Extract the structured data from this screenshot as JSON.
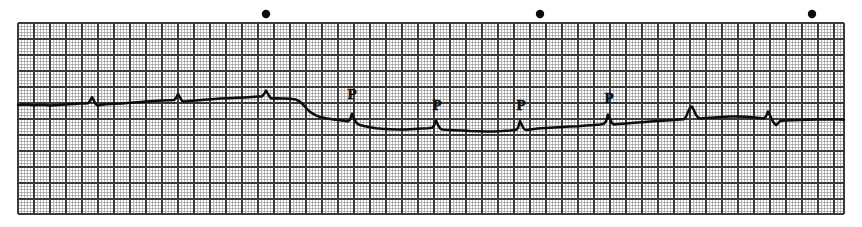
{
  "figure": {
    "kind": "ecg-rhythm-strip",
    "width": 862,
    "height": 227,
    "background_color": "#ffffff",
    "paper_color": "#fdfdfd"
  },
  "grid": {
    "x": 18,
    "y": 23,
    "width": 826,
    "height": 191,
    "small_box_px": 3.2,
    "large_box_px": 16.0,
    "small_line_color": "#9a9a9a",
    "large_line_color": "#3a3a3a",
    "small_line_width": 0.7,
    "large_line_width": 1.15,
    "grid_on": true
  },
  "trace": {
    "color": "#0d0d0d",
    "line_width": 2.5,
    "baseline_left_y": 105,
    "baseline_mid_y": 122,
    "baseline_right_y": 118
  },
  "calibration_dots": {
    "marker_name": "calibration-dot",
    "color": "#0a0a0a",
    "radius": 4.2,
    "y": 14,
    "x_positions": [
      266,
      540,
      812
    ]
  },
  "annotations": {
    "p_wave_label": "P",
    "p_wave_markers": [
      {
        "label": "P",
        "x": 352,
        "y": 99
      },
      {
        "label": "P",
        "x": 437,
        "y": 110
      },
      {
        "label": "P",
        "x": 521,
        "y": 110
      },
      {
        "label": "P",
        "x": 609,
        "y": 103
      }
    ]
  },
  "chart_data": {
    "type": "line",
    "title": "",
    "xlabel": "",
    "ylabel": "",
    "xlim": [
      18,
      844
    ],
    "ylim": [
      23,
      214
    ],
    "grid": true,
    "legend": null,
    "series": [
      {
        "name": "ecg-lead-trace",
        "points": [
          [
            18,
            105
          ],
          [
            26,
            104.6
          ],
          [
            34,
            105.2
          ],
          [
            42,
            104.8
          ],
          [
            50,
            105.4
          ],
          [
            58,
            105.0
          ],
          [
            66,
            104.4
          ],
          [
            74,
            104.0
          ],
          [
            80,
            103.6
          ],
          [
            84,
            103.4
          ],
          [
            88,
            103.2
          ],
          [
            90,
            101.0
          ],
          [
            92,
            97.2
          ],
          [
            94,
            100.8
          ],
          [
            96,
            104.4
          ],
          [
            98,
            105.6
          ],
          [
            100,
            105.0
          ],
          [
            106,
            104.2
          ],
          [
            114,
            103.8
          ],
          [
            122,
            103.4
          ],
          [
            130,
            102.8
          ],
          [
            138,
            102.2
          ],
          [
            146,
            101.6
          ],
          [
            154,
            101.0
          ],
          [
            162,
            100.6
          ],
          [
            170,
            100.2
          ],
          [
            174,
            100.0
          ],
          [
            176,
            98.0
          ],
          [
            178,
            94.2
          ],
          [
            180,
            97.4
          ],
          [
            182,
            100.8
          ],
          [
            184,
            101.6
          ],
          [
            188,
            101.0
          ],
          [
            196,
            100.4
          ],
          [
            204,
            99.8
          ],
          [
            212,
            99.2
          ],
          [
            220,
            98.6
          ],
          [
            228,
            98.2
          ],
          [
            236,
            97.8
          ],
          [
            244,
            97.4
          ],
          [
            252,
            97.0
          ],
          [
            258,
            96.6
          ],
          [
            262,
            96.4
          ],
          [
            264,
            94.2
          ],
          [
            266,
            90.6
          ],
          [
            268,
            94.0
          ],
          [
            270,
            97.4
          ],
          [
            272,
            98.6
          ],
          [
            276,
            98.2
          ],
          [
            284,
            98.4
          ],
          [
            290,
            98.8
          ],
          [
            296,
            99.6
          ],
          [
            300,
            101.6
          ],
          [
            304,
            105.6
          ],
          [
            308,
            110.0
          ],
          [
            312,
            113.2
          ],
          [
            316,
            115.4
          ],
          [
            320,
            117.0
          ],
          [
            326,
            118.2
          ],
          [
            332,
            119.2
          ],
          [
            338,
            120.0
          ],
          [
            344,
            120.8
          ],
          [
            348,
            121.4
          ],
          [
            350,
            119.6
          ],
          [
            352,
            113.8
          ],
          [
            354,
            118.2
          ],
          [
            356,
            122.4
          ],
          [
            358,
            124.2
          ],
          [
            360,
            125.0
          ],
          [
            364,
            126.0
          ],
          [
            370,
            127.2
          ],
          [
            376,
            128.2
          ],
          [
            382,
            128.8
          ],
          [
            390,
            129.2
          ],
          [
            398,
            129.6
          ],
          [
            406,
            129.4
          ],
          [
            414,
            129.0
          ],
          [
            422,
            128.6
          ],
          [
            428,
            128.2
          ],
          [
            432,
            127.8
          ],
          [
            434,
            125.6
          ],
          [
            436,
            120.6
          ],
          [
            438,
            124.8
          ],
          [
            440,
            128.4
          ],
          [
            442,
            129.4
          ],
          [
            446,
            129.8
          ],
          [
            454,
            130.2
          ],
          [
            462,
            130.6
          ],
          [
            470,
            131.0
          ],
          [
            478,
            131.2
          ],
          [
            486,
            131.4
          ],
          [
            494,
            131.4
          ],
          [
            502,
            131.0
          ],
          [
            510,
            130.4
          ],
          [
            516,
            129.8
          ],
          [
            518,
            128.0
          ],
          [
            520,
            121.0
          ],
          [
            522,
            125.4
          ],
          [
            524,
            129.0
          ],
          [
            526,
            130.0
          ],
          [
            530,
            129.4
          ],
          [
            538,
            128.6
          ],
          [
            546,
            128.0
          ],
          [
            554,
            127.4
          ],
          [
            562,
            127.0
          ],
          [
            570,
            126.6
          ],
          [
            578,
            126.2
          ],
          [
            586,
            125.6
          ],
          [
            594,
            125.0
          ],
          [
            600,
            124.4
          ],
          [
            604,
            123.8
          ],
          [
            606,
            121.4
          ],
          [
            608,
            114.6
          ],
          [
            610,
            119.4
          ],
          [
            612,
            123.2
          ],
          [
            614,
            124.4
          ],
          [
            618,
            124.0
          ],
          [
            626,
            123.4
          ],
          [
            634,
            122.8
          ],
          [
            642,
            122.2
          ],
          [
            650,
            121.6
          ],
          [
            658,
            121.0
          ],
          [
            666,
            120.4
          ],
          [
            674,
            120.0
          ],
          [
            680,
            119.6
          ],
          [
            684,
            119.2
          ],
          [
            686,
            116.8
          ],
          [
            688,
            112.0
          ],
          [
            690,
            107.8
          ],
          [
            692,
            106.6
          ],
          [
            694,
            110.4
          ],
          [
            696,
            115.0
          ],
          [
            698,
            117.6
          ],
          [
            700,
            118.4
          ],
          [
            706,
            118.0
          ],
          [
            714,
            117.4
          ],
          [
            722,
            117.0
          ],
          [
            730,
            116.6
          ],
          [
            738,
            116.4
          ],
          [
            746,
            116.8
          ],
          [
            754,
            117.4
          ],
          [
            760,
            118.0
          ],
          [
            764,
            118.6
          ],
          [
            766,
            116.2
          ],
          [
            768,
            111.6
          ],
          [
            770,
            115.4
          ],
          [
            772,
            119.6
          ],
          [
            774,
            123.2
          ],
          [
            776,
            125.2
          ],
          [
            778,
            123.4
          ],
          [
            780,
            121.0
          ],
          [
            784,
            120.4
          ],
          [
            792,
            120.2
          ],
          [
            800,
            120.0
          ],
          [
            808,
            119.8
          ],
          [
            816,
            119.6
          ],
          [
            824,
            119.4
          ],
          [
            832,
            119.4
          ],
          [
            840,
            119.6
          ],
          [
            844,
            119.8
          ]
        ]
      }
    ]
  }
}
